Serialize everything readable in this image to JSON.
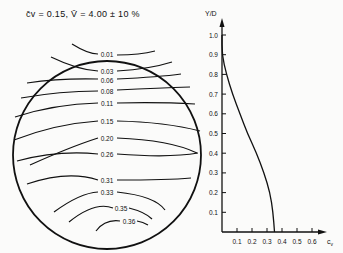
{
  "chart_data": [
    {
      "type": "contour",
      "title": "c̄v = 0.15, V̄ = 4.00 ± 10 %",
      "description": "Cross-section (circular pipe) contour lines of concentration",
      "contour_levels": [
        "0.01",
        "0.03",
        "0.06",
        "0.08",
        "0.11",
        "0.15",
        "0.20",
        "0.26",
        "0.31",
        "0.33",
        "0.35",
        "0.36"
      ]
    },
    {
      "type": "line",
      "title": "",
      "xlabel": "c_v",
      "ylabel": "Y/D",
      "xlim": [
        0,
        0.7
      ],
      "ylim": [
        0,
        1.05
      ],
      "x_ticks": [
        "0.1",
        "0.2",
        "0.3",
        "0.4",
        "0.5",
        "0.6"
      ],
      "y_ticks": [
        "0.1",
        "0.2",
        "0.3",
        "0.4",
        "0.5",
        "0.6",
        "0.7",
        "0.8",
        "0.9",
        "1.0"
      ],
      "series": [
        {
          "name": "concentration profile",
          "points": [
            [
              0.0,
              1.0
            ],
            [
              0.0,
              0.9
            ],
            [
              0.03,
              0.8
            ],
            [
              0.07,
              0.7
            ],
            [
              0.12,
              0.6
            ],
            [
              0.17,
              0.5
            ],
            [
              0.23,
              0.4
            ],
            [
              0.28,
              0.3
            ],
            [
              0.32,
              0.2
            ],
            [
              0.34,
              0.1
            ],
            [
              0.35,
              0.0
            ]
          ]
        }
      ]
    }
  ],
  "labels": {
    "title": "c̄v = 0.15,  V̄ = 4.00 ± 10 %",
    "x_axis": "c",
    "x_axis_sub": "v",
    "y_axis": "Y/D"
  }
}
